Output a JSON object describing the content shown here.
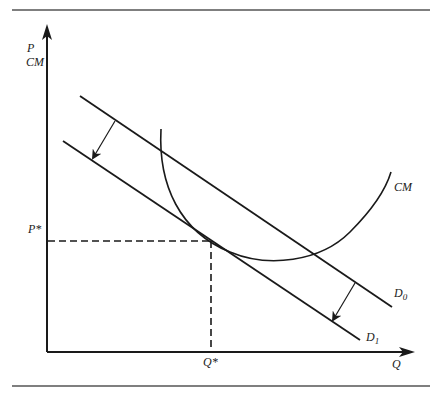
{
  "diagram": {
    "y_axis_label_line1": "P",
    "y_axis_label_line2": "CM",
    "x_axis_label": "Q",
    "price_marker": "P*",
    "quantity_marker": "Q*",
    "cost_curve_label": "CM",
    "demand_initial_label": "D",
    "demand_initial_sub": "0",
    "demand_shifted_label": "D",
    "demand_shifted_sub": "1",
    "line_color": "#1a1a1a",
    "rule_color": "#555555"
  }
}
